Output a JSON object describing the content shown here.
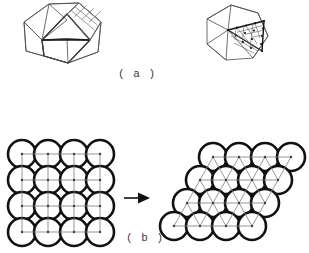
{
  "figure": {
    "background_color": "#ffffff",
    "ink_color": "#111111",
    "lattice_line_color": "#7c7c7c",
    "panels": [
      {
        "id": "a",
        "label": "( a )"
      },
      {
        "id": "b",
        "label": "( b )"
      }
    ]
  },
  "panel_a": {
    "left_shape": {
      "name": "rhombic-polyhedron",
      "outline_points": "49,4 79,2 101,22 97,52 67,62 28,50 24,22",
      "patterned_face_rows": 3,
      "patterned_face_cols": 3
    },
    "right_shape": {
      "name": "icosahedron",
      "subdivision_rows": 4,
      "vertex_dots": 15
    }
  },
  "panel_b": {
    "left_packing": {
      "name": "square-lattice-packing",
      "lattice_type": "square",
      "rows": 4,
      "columns": 4,
      "circle_count": 16,
      "circle_radius": 14,
      "spacing": 26,
      "origin_x": 22,
      "origin_y": 154
    },
    "right_packing": {
      "name": "hexagonal-close-packing",
      "lattice_type": "hexagonal",
      "rows": 4,
      "columns": 4,
      "circle_count": 16,
      "circle_radius": 14,
      "spacing_x": 26,
      "spacing_y": 23,
      "row_shift": -13,
      "origin_x": 213,
      "origin_y": 157
    },
    "arrow": {
      "name": "transformation-arrow",
      "direction": "right",
      "x": 124,
      "y": 198,
      "length": 24
    }
  }
}
